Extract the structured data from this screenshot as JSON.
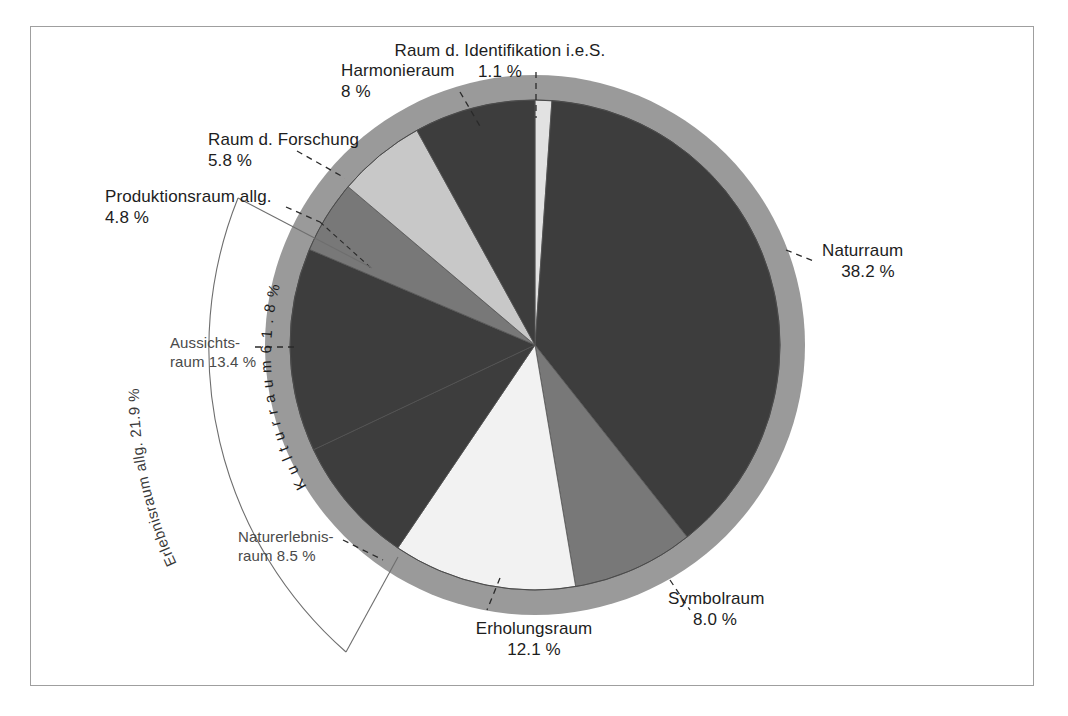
{
  "chart_data": {
    "type": "pie",
    "title": "",
    "subtitle": "",
    "xlabel": "",
    "ylabel": "",
    "legend_position": "callout-labels",
    "grid": false,
    "unit": "%",
    "start_angle_deg": 0,
    "direction": "clockwise",
    "categories": [
      "Raum d. Identifikation i.e.S.",
      "Naturraum",
      "Symbolraum",
      "Erholungsraum",
      "Naturerlebnisraum",
      "Aussichtsraum",
      "Produktionsraum allg.",
      "Raum d. Forschung",
      "Harmonieraum"
    ],
    "values": [
      1.1,
      38.2,
      8.0,
      12.1,
      8.5,
      13.4,
      4.8,
      5.8,
      8.0
    ],
    "slice_colors": [
      "#e2e2e2",
      "#3d3d3d",
      "#787878",
      "#f2f2f2",
      "#3d3d3d",
      "#3d3d3d",
      "#787878",
      "#c8c8c8",
      "#3d3d3d"
    ],
    "groups": [
      {
        "name": "Kulturraum",
        "value": 61.8,
        "label": "Kulturraum 61.8 %"
      },
      {
        "name": "Erlebnisraum allg.",
        "value": 21.9,
        "label": "Erlebnisraum allg. 21.9 %"
      }
    ],
    "outer_ring_color": "#9a9a9a"
  },
  "labels": {
    "identifikation": {
      "name": "Raum d. Identifikation i.e.S.",
      "value": "1.1 %"
    },
    "naturraum": {
      "name": "Naturraum",
      "value": "38.2 %"
    },
    "symbolraum": {
      "name": "Symbolraum",
      "value": "8.0 %"
    },
    "erholungsraum": {
      "name": "Erholungsraum",
      "value": "12.1 %"
    },
    "naturerlebnisraum": {
      "name": "Naturerlebnis-",
      "value": "raum 8.5 %"
    },
    "aussichtsraum": {
      "name": "Aussichts-",
      "value": "raum 13.4 %"
    },
    "produktionsraum": {
      "name": "Produktionsraum allg.",
      "value": "4.8 %"
    },
    "forschung": {
      "name": "Raum d. Forschung",
      "value": "5.8 %"
    },
    "harmonieraum": {
      "name": "Harmonieraum",
      "value": "8 %"
    }
  },
  "arcs": {
    "kulturraum": "K u l t u r r a u m   6 1 . 8  %",
    "erlebnisraum": "Erlebnisraum allg. 21.9 %"
  }
}
